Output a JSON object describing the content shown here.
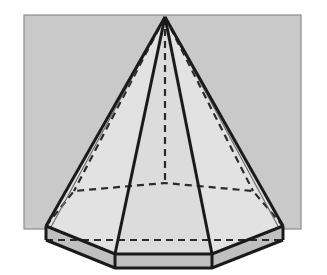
{
  "figure": {
    "title": "Heptagonal pyramid in perspective",
    "kind": "geometric-solid-illustration",
    "solid_name": "heptagonal pyramid",
    "base_sides": 7,
    "canvas": {
      "width": 327,
      "height": 275
    },
    "colors": {
      "page_background": "#ffffff",
      "backdrop_panel_fill": "#c9c9c9",
      "backdrop_panel_stroke": "#8c8c8c",
      "lateral_face_light": "#e2e2e2",
      "lateral_face_mid": "#dcdcdc",
      "base_top_fill": "#c4c4c4",
      "base_front_fill": "#c0c0c0",
      "edge_solid": "#1a1a1a",
      "edge_hidden": "#2b2b2b",
      "edge_thin_gray": "#6e6e6e"
    },
    "stroke_widths": {
      "visible_edge": 3.0,
      "hidden_edge": 2.2,
      "thin_guide": 1.2,
      "panel_border": 1.2
    },
    "dash_pattern": "7 5",
    "backdrop_panel": {
      "x": 24,
      "y": 15,
      "width": 277,
      "height": 214
    },
    "apex": {
      "x": 165,
      "y": 17
    },
    "base_top_polygon": [
      {
        "name": "left",
        "x": 46,
        "y": 226,
        "hidden": false
      },
      {
        "name": "front-left",
        "x": 115,
        "y": 254,
        "hidden": false
      },
      {
        "name": "front-right",
        "x": 212,
        "y": 254,
        "hidden": false
      },
      {
        "name": "right",
        "x": 283,
        "y": 226,
        "hidden": false
      },
      {
        "name": "back-right",
        "x": 253,
        "y": 191,
        "hidden": true
      },
      {
        "name": "back-center",
        "x": 165,
        "y": 183,
        "hidden": true
      },
      {
        "name": "back-left",
        "x": 74,
        "y": 191,
        "hidden": true
      }
    ],
    "base_bottom_polygon": [
      {
        "name": "left",
        "x": 46,
        "y": 240
      },
      {
        "name": "front-left",
        "x": 115,
        "y": 268
      },
      {
        "name": "front-right",
        "x": 212,
        "y": 268
      },
      {
        "name": "right",
        "x": 283,
        "y": 240
      }
    ],
    "visible_lateral_edges": [
      {
        "from": "apex",
        "to": "left"
      },
      {
        "from": "apex",
        "to": "front-left"
      },
      {
        "from": "apex",
        "to": "front-right"
      },
      {
        "from": "apex",
        "to": "right"
      }
    ],
    "hidden_lateral_edges": [
      {
        "from": "apex",
        "to": "back-left"
      },
      {
        "from": "apex",
        "to": "back-center"
      },
      {
        "from": "apex",
        "to": "back-right"
      }
    ],
    "hidden_base_edges": [
      {
        "from": "left",
        "to": "back-left"
      },
      {
        "from": "back-left",
        "to": "back-center"
      },
      {
        "from": "back-center",
        "to": "back-right"
      },
      {
        "from": "back-right",
        "to": "right"
      },
      {
        "from": "left",
        "to": "right",
        "note": "rear horizontal of lower rim"
      }
    ],
    "labels": [],
    "annotations": []
  }
}
